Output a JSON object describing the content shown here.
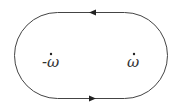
{
  "diagram": {
    "type": "closed contour (stadium shape)",
    "stroke_color": "#444444",
    "contour": {
      "orientation": "counterclockwise",
      "top_arrow_direction": "left",
      "bottom_arrow_direction": "right"
    },
    "points": [
      {
        "id": "left-point",
        "label": "-ω"
      },
      {
        "id": "right-point",
        "label": "ω"
      }
    ]
  }
}
